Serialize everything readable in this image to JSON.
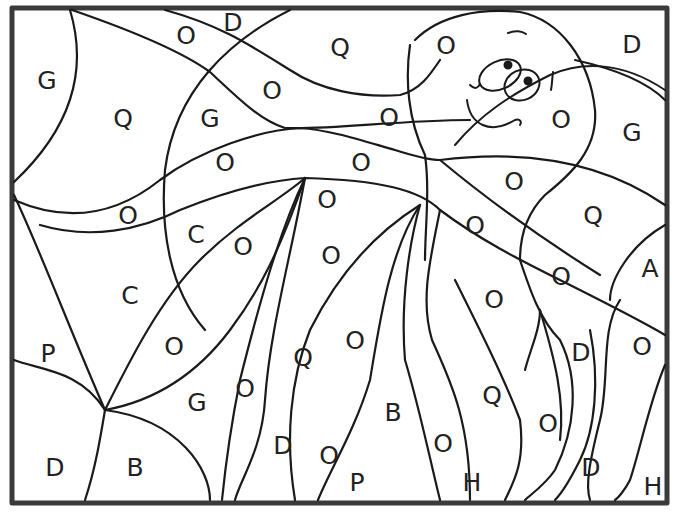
{
  "page": {
    "type": "color-by-letter coloring page",
    "border_color": "#3a3a3a",
    "line_color": "#1a1a1a"
  },
  "labels": [
    {
      "text": "D",
      "x": 233,
      "y": 22
    },
    {
      "text": "O",
      "x": 186,
      "y": 35
    },
    {
      "text": "Q",
      "x": 340,
      "y": 47
    },
    {
      "text": "O",
      "x": 446,
      "y": 45
    },
    {
      "text": "D",
      "x": 632,
      "y": 44
    },
    {
      "text": "G",
      "x": 47,
      "y": 80
    },
    {
      "text": "Q",
      "x": 123,
      "y": 118
    },
    {
      "text": "G",
      "x": 210,
      "y": 118
    },
    {
      "text": "O",
      "x": 272,
      "y": 90
    },
    {
      "text": "O",
      "x": 389,
      "y": 117
    },
    {
      "text": "O",
      "x": 561,
      "y": 119
    },
    {
      "text": "G",
      "x": 632,
      "y": 132
    },
    {
      "text": "O",
      "x": 225,
      "y": 162
    },
    {
      "text": "O",
      "x": 361,
      "y": 162
    },
    {
      "text": "O",
      "x": 514,
      "y": 181
    },
    {
      "text": "O",
      "x": 128,
      "y": 215
    },
    {
      "text": "O",
      "x": 327,
      "y": 199
    },
    {
      "text": "Q",
      "x": 593,
      "y": 215
    },
    {
      "text": "C",
      "x": 196,
      "y": 234
    },
    {
      "text": "O",
      "x": 243,
      "y": 246
    },
    {
      "text": "O",
      "x": 475,
      "y": 225
    },
    {
      "text": "O",
      "x": 331,
      "y": 255
    },
    {
      "text": "A",
      "x": 650,
      "y": 268
    },
    {
      "text": "C",
      "x": 130,
      "y": 295
    },
    {
      "text": "O",
      "x": 561,
      "y": 276
    },
    {
      "text": "O",
      "x": 494,
      "y": 299
    },
    {
      "text": "P",
      "x": 48,
      "y": 353
    },
    {
      "text": "O",
      "x": 174,
      "y": 346
    },
    {
      "text": "O",
      "x": 355,
      "y": 340
    },
    {
      "text": "Q",
      "x": 303,
      "y": 357
    },
    {
      "text": "D",
      "x": 581,
      "y": 352
    },
    {
      "text": "O",
      "x": 642,
      "y": 346
    },
    {
      "text": "G",
      "x": 197,
      "y": 402
    },
    {
      "text": "O",
      "x": 245,
      "y": 388
    },
    {
      "text": "B",
      "x": 393,
      "y": 412
    },
    {
      "text": "Q",
      "x": 492,
      "y": 395
    },
    {
      "text": "O",
      "x": 548,
      "y": 423
    },
    {
      "text": "D",
      "x": 283,
      "y": 445
    },
    {
      "text": "O",
      "x": 329,
      "y": 455
    },
    {
      "text": "O",
      "x": 443,
      "y": 443
    },
    {
      "text": "D",
      "x": 55,
      "y": 467
    },
    {
      "text": "B",
      "x": 135,
      "y": 467
    },
    {
      "text": "P",
      "x": 357,
      "y": 482
    },
    {
      "text": "H",
      "x": 472,
      "y": 482
    },
    {
      "text": "D",
      "x": 591,
      "y": 467
    },
    {
      "text": "H",
      "x": 653,
      "y": 486
    }
  ]
}
